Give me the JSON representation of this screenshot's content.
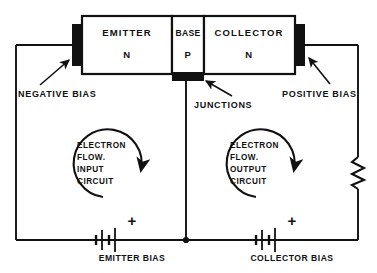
{
  "diagram": {
    "stroke_color": "#111111",
    "background_color": "#ffffff",
    "transistor": {
      "emitter": {
        "name": "EMITTER",
        "doping": "N"
      },
      "base": {
        "name": "BASE",
        "doping": "P"
      },
      "collector": {
        "name": "COLLECTOR",
        "doping": "N"
      }
    },
    "callouts": {
      "negative_bias": "NEGATIVE BIAS",
      "junctions": "JUNCTIONS",
      "positive_bias": "POSITIVE BIAS"
    },
    "input_loop": {
      "line1": "ELECTRON",
      "line2": "FLOW.",
      "line3": "INPUT",
      "line4": "CIRCUIT"
    },
    "output_loop": {
      "line1": "ELECTRON",
      "line2": "FLOW.",
      "line3": "OUTPUT",
      "line4": "CIRCUIT"
    },
    "batteries": {
      "emitter": {
        "label": "EMITTER BIAS",
        "polarity": "+"
      },
      "collector": {
        "label": "COLLECTOR BIAS",
        "polarity": "+"
      }
    },
    "resistor": {
      "name": "load-resistor",
      "orientation": "vertical"
    }
  }
}
